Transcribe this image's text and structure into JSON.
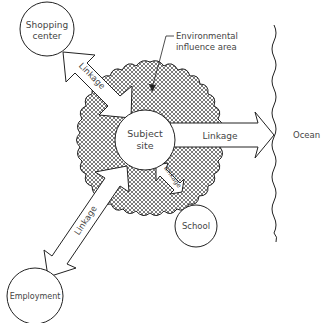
{
  "diagram": {
    "nodes": {
      "subject_site": {
        "line1": "Subject",
        "line2": "site"
      },
      "shopping_center": {
        "line1": "Shopping",
        "line2": "center"
      },
      "school": {
        "label": "School"
      },
      "employment": {
        "label": "Employment"
      },
      "ocean": {
        "label": "Ocean"
      }
    },
    "influence_area": {
      "line1": "Environmental",
      "line2": "influence area"
    },
    "linkages": {
      "shopping": "Linkage",
      "ocean": "Linkage",
      "school": "Linkage",
      "employment": "Linkage"
    }
  }
}
